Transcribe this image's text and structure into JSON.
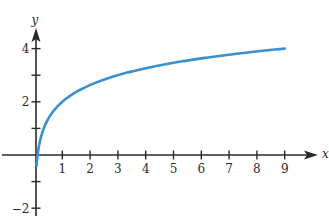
{
  "chart_data": {
    "type": "line",
    "title": "",
    "function": "y = 2 + log_3(x)",
    "xlabel": "x",
    "ylabel": "y",
    "xlim": [
      -0.9,
      9.9
    ],
    "ylim": [
      -2.3,
      4.8
    ],
    "x_ticks": [
      1,
      2,
      3,
      4,
      5,
      6,
      7,
      8,
      9
    ],
    "x_tick_labels": [
      "1",
      "2",
      "3",
      "4",
      "5",
      "6",
      "7",
      "8",
      "9"
    ],
    "y_ticks": [
      -2,
      -1,
      1,
      2,
      3,
      4
    ],
    "y_tick_labels": [
      {
        "value": -2,
        "label": "−2"
      },
      {
        "value": 2,
        "label": "2"
      },
      {
        "value": 4,
        "label": "4"
      }
    ],
    "grid": false,
    "legend": null,
    "series": [
      {
        "name": "curve",
        "color": "#3a8fcf",
        "x": [
          0.07,
          0.11,
          0.2,
          0.33,
          0.5,
          0.75,
          1,
          1.5,
          2,
          3,
          4,
          5,
          6,
          7,
          8,
          9
        ],
        "values": [
          -0.42,
          0.0,
          0.54,
          0.99,
          1.37,
          1.74,
          2.0,
          2.37,
          2.63,
          3.0,
          3.26,
          3.46,
          3.63,
          3.77,
          3.89,
          4.0
        ]
      }
    ]
  },
  "colors": {
    "axis": "#2a2a2a",
    "curve": "#3a8fcf",
    "background": "#ffffff"
  }
}
